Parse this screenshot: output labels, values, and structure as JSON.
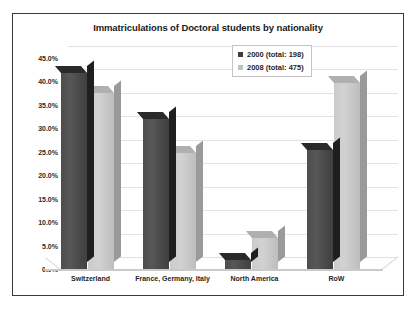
{
  "chart_data": {
    "type": "bar",
    "title": "Immatriculations of Doctoral students by nationality",
    "xlabel": "",
    "ylabel": "",
    "ylim": [
      0,
      47.5
    ],
    "ytick_step": 5,
    "grid": true,
    "legend_position": "top-right",
    "style": "3d-clustered-column",
    "categories": [
      "Switzerland",
      "France, Germany, Italy",
      "North America",
      "RoW"
    ],
    "ytick_labels": [
      "45.0%",
      "40.0%",
      "35.0%",
      "30.0%",
      "25.0%",
      "20.0%",
      "15.0%",
      "10.0%",
      "5.0%",
      "0.0%"
    ],
    "ytick_values": [
      45,
      40,
      35,
      30,
      25,
      20,
      15,
      10,
      5,
      0
    ],
    "series": [
      {
        "name": "2000 (total: 198)",
        "color": "#4a4a4a",
        "values": [
          41.7,
          32.0,
          2.0,
          25.3
        ]
      },
      {
        "name": "2008 (total: 475)",
        "color": "#c8c8c8",
        "values": [
          37.5,
          24.7,
          6.5,
          39.5
        ]
      }
    ]
  },
  "colors": {
    "series_2000": "#4a4a4a",
    "series_2008": "#c8c8c8",
    "frame_border": "#3a3a44",
    "gridline": "#e3e3e6",
    "plot_background": "#ffffff"
  }
}
